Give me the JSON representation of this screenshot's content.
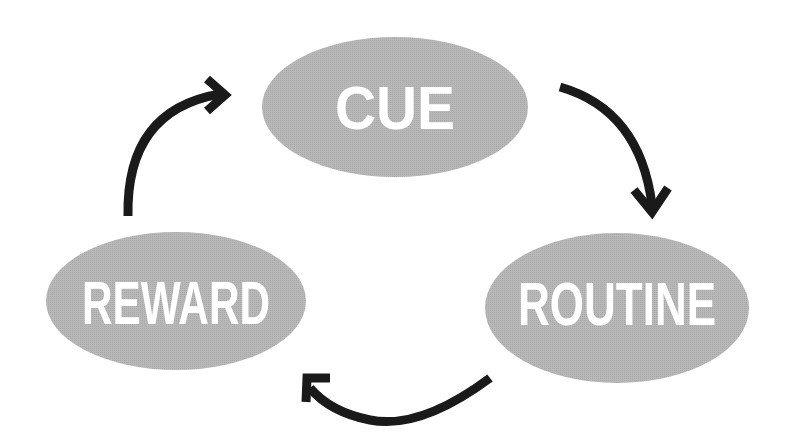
{
  "diagram": {
    "type": "cycle",
    "colors": {
      "node_fill": "#b4b4b4",
      "label_text": "#ffffff",
      "arrow": "#1a1a1a",
      "background": "#ffffff"
    },
    "nodes": [
      {
        "id": "cue",
        "label": "CUE",
        "cx": 395,
        "cy": 107,
        "rx": 133,
        "ry": 70
      },
      {
        "id": "routine",
        "label": "ROUTINE",
        "cx": 617,
        "cy": 308,
        "rx": 132,
        "ry": 75
      },
      {
        "id": "reward",
        "label": "REWARD",
        "cx": 176,
        "cy": 301,
        "rx": 130,
        "ry": 69
      }
    ],
    "edges": [
      {
        "from": "cue",
        "to": "routine"
      },
      {
        "from": "routine",
        "to": "reward"
      },
      {
        "from": "reward",
        "to": "cue"
      }
    ]
  }
}
